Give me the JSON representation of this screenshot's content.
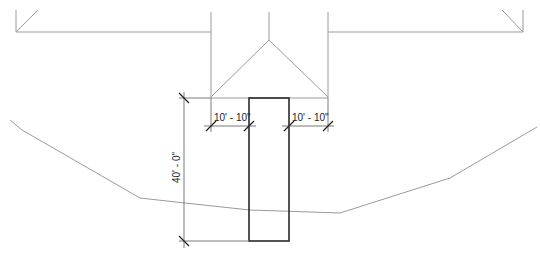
{
  "drawing": {
    "type": "plan-view site drawing",
    "dimensions": {
      "left_offset": "10' - 10\"",
      "right_offset": "10' - 10\"",
      "length": "40' - 0\""
    },
    "colors": {
      "background": "#ffffff",
      "thin_line": "#9a9a9a",
      "heavy_line": "#2a2a2a",
      "text": "#222222"
    }
  }
}
